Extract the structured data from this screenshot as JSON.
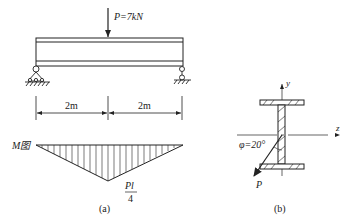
{
  "figure_a": {
    "load_label": "P=7kN",
    "span_left": "2m",
    "span_right": "2m",
    "moment_label": "M图",
    "moment_peak_num": "Pl",
    "moment_peak_den": "4",
    "caption": "(a)"
  },
  "figure_b": {
    "y_axis": "y",
    "z_axis": "z",
    "angle_label": "φ=20°",
    "force_label": "P",
    "caption": "(b)"
  },
  "colors": {
    "line": "#222222",
    "background": "#ffffff"
  }
}
